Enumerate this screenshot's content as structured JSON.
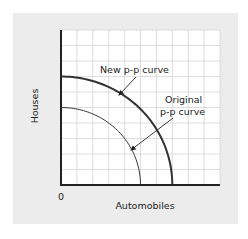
{
  "chart_data": {
    "type": "line",
    "title": "",
    "xlabel": "Automobiles",
    "ylabel": "Houses",
    "origin_label": "0",
    "xlim": [
      0,
      10
    ],
    "ylim": [
      0,
      10
    ],
    "grid": true,
    "grid_divisions": {
      "x": 10,
      "y": 10
    },
    "series": [
      {
        "name": "New p-p curve",
        "shape": "concave quarter-ellipse",
        "y_intercept": 7,
        "x_intercept": 7,
        "stroke_width": "thick"
      },
      {
        "name": "Original p-p curve",
        "shape": "concave quarter-ellipse",
        "y_intercept": 5,
        "x_intercept": 5,
        "stroke_width": "thin"
      }
    ],
    "annotations": [
      {
        "text": "New p-p curve",
        "arrow_to": "New p-p curve"
      },
      {
        "text": "Original p-p curve",
        "lines": [
          "Original",
          "p-p curve"
        ],
        "arrow_to": "Original p-p curve"
      }
    ],
    "legend": "none"
  },
  "labels": {
    "x_axis": "Automobiles",
    "y_axis": "Houses",
    "origin": "0",
    "new_curve": "New p-p curve",
    "original_line1": "Original",
    "original_line2": "p-p curve"
  },
  "colors": {
    "panel_bg": "#ececec",
    "plot_bg": "#ffffff",
    "grid": "#d6d6d6",
    "axis": "#222222",
    "curve": "#333333"
  }
}
